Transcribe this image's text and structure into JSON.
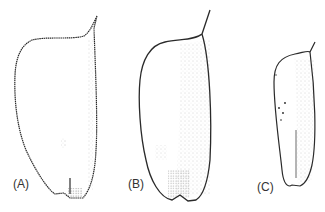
{
  "figure": {
    "panels": [
      {
        "id": "A",
        "label": "(A)"
      },
      {
        "id": "B",
        "label": "(B)"
      },
      {
        "id": "C",
        "label": "(C)"
      }
    ],
    "colors": {
      "line": "#2a2a2a",
      "stipple": "#555555",
      "background": "#ffffff"
    }
  }
}
